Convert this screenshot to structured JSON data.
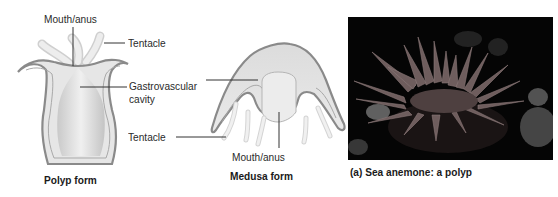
{
  "polyp": {
    "mouth_label": "Mouth/anus",
    "tentacle_label": "Tentacle",
    "cavity_label_line1": "Gastrovascular",
    "cavity_label_line2": "cavity",
    "caption": "Polyp form"
  },
  "medusa": {
    "tentacle_label": "Tentacle",
    "mouth_label": "Mouth/anus",
    "caption": "Medusa form"
  },
  "photo": {
    "caption": "(a) Sea anemone:  a polyp",
    "subject": "sea-anemone-photo"
  },
  "colors": {
    "outline": "#8a8a8a",
    "fill": "#e4e4e4",
    "tentacle": "#efefef",
    "leader_line": "#333333",
    "photo_bg": "#050505",
    "anemone": "#6e5d5d"
  }
}
